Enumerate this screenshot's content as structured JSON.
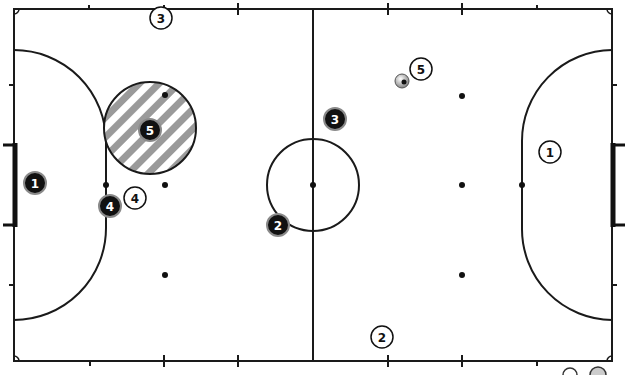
{
  "diagram": {
    "type": "futsal-court-tactics",
    "colors": {
      "line": "#1a1a1a",
      "background": "#ffffff",
      "team_dark": "#111111",
      "team_dark_ring": "#8a8a8a",
      "team_light": "#ffffff",
      "hatch_stripe": "#9a9a9a"
    },
    "court": {
      "left": 14,
      "top": 9,
      "right": 612,
      "bottom": 361,
      "center_line_x": 313,
      "center_circle": {
        "cx": 313,
        "cy": 185,
        "r": 46
      },
      "left_goal": {
        "y1": 144,
        "y2": 226
      },
      "right_goal": {
        "y1": 144,
        "y2": 226
      }
    },
    "dark_team": [
      {
        "label": "1",
        "x": 35,
        "y": 183
      },
      {
        "label": "2",
        "x": 278,
        "y": 225
      },
      {
        "label": "3",
        "x": 335,
        "y": 119
      },
      {
        "label": "4",
        "x": 110,
        "y": 206
      },
      {
        "label": "5",
        "x": 150,
        "y": 130
      }
    ],
    "light_team": [
      {
        "label": "1",
        "x": 550,
        "y": 152
      },
      {
        "label": "2",
        "x": 382,
        "y": 337
      },
      {
        "label": "3",
        "x": 161,
        "y": 18
      },
      {
        "label": "4",
        "x": 135,
        "y": 198
      },
      {
        "label": "5",
        "x": 421,
        "y": 69
      }
    ],
    "ball": {
      "x": 402,
      "y": 81
    },
    "zone": {
      "label": "hatched-zone",
      "cx": 150,
      "cy": 128,
      "r": 46
    }
  }
}
